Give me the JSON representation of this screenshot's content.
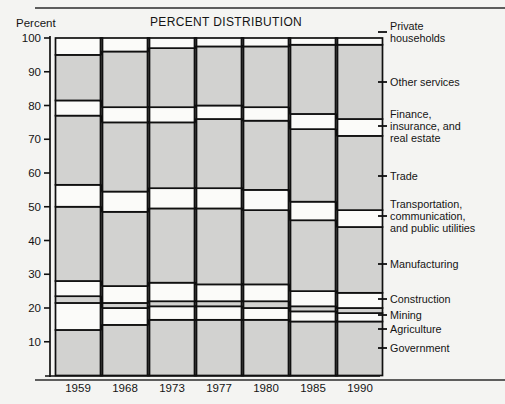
{
  "chart_data": {
    "type": "area",
    "title": "PERCENT DISTRIBUTION",
    "ylabel": "Percent",
    "xlabel": "",
    "grid": false,
    "legend_position": "right",
    "ylim": [
      0,
      100
    ],
    "yticks": [
      10,
      20,
      30,
      40,
      50,
      60,
      70,
      80,
      90,
      100
    ],
    "categories": [
      "1959",
      "1968",
      "1973",
      "1977",
      "1980",
      "1985",
      "1990"
    ],
    "stack_order_bottom_to_top": [
      "Government",
      "Agriculture",
      "Mining",
      "Construction",
      "Manufacturing",
      "Transportation, communication, and public utilities",
      "Trade",
      "Finance, insurance, and real estate",
      "Other services",
      "Private households"
    ],
    "series": [
      {
        "name": "Government",
        "fill": "shaded",
        "values": [
          13.5,
          15.0,
          16.5,
          16.5,
          16.5,
          16.0,
          16.0
        ]
      },
      {
        "name": "Agriculture",
        "fill": "open",
        "values": [
          8.0,
          5.0,
          4.0,
          4.0,
          3.5,
          3.0,
          2.5
        ]
      },
      {
        "name": "Mining",
        "fill": "shaded",
        "values": [
          2.0,
          1.5,
          1.5,
          1.5,
          2.0,
          1.5,
          1.5
        ]
      },
      {
        "name": "Construction",
        "fill": "open",
        "values": [
          4.5,
          5.0,
          5.5,
          5.0,
          5.0,
          4.5,
          4.5
        ]
      },
      {
        "name": "Manufacturing",
        "fill": "shaded",
        "values": [
          22.0,
          22.0,
          22.0,
          22.5,
          22.0,
          21.0,
          19.5
        ]
      },
      {
        "name": "Transportation, communication, and public utilities",
        "fill": "open",
        "values": [
          6.5,
          6.0,
          6.0,
          6.0,
          6.0,
          5.5,
          5.0
        ]
      },
      {
        "name": "Trade",
        "fill": "shaded",
        "values": [
          20.5,
          20.5,
          19.5,
          20.5,
          20.5,
          21.5,
          22.0
        ]
      },
      {
        "name": "Finance, insurance, and real estate",
        "fill": "open",
        "values": [
          4.5,
          4.5,
          4.5,
          4.0,
          4.0,
          4.5,
          5.0
        ]
      },
      {
        "name": "Other services",
        "fill": "shaded",
        "values": [
          13.5,
          16.5,
          17.5,
          17.5,
          18.0,
          20.5,
          22.0
        ]
      },
      {
        "name": "Private households",
        "fill": "open",
        "values": [
          5.0,
          4.0,
          3.0,
          2.5,
          2.5,
          2.0,
          2.0
        ]
      }
    ]
  },
  "axis": {
    "y_title": "Percent",
    "y_ticks": [
      "100",
      "90",
      "80",
      "70",
      "60",
      "50",
      "40",
      "30",
      "20",
      "10"
    ],
    "x_ticks": [
      "1959",
      "1968",
      "1973",
      "1977",
      "1980",
      "1985",
      "1990"
    ]
  },
  "title": {
    "main": "PERCENT DISTRIBUTION"
  },
  "legend": {
    "items": [
      {
        "label_line1": "Private",
        "label_line2": "households",
        "label_line3": ""
      },
      {
        "label_line1": "Other services",
        "label_line2": "",
        "label_line3": ""
      },
      {
        "label_line1": "Finance,",
        "label_line2": "insurance, and",
        "label_line3": "real estate"
      },
      {
        "label_line1": "Trade",
        "label_line2": "",
        "label_line3": ""
      },
      {
        "label_line1": "Transportation,",
        "label_line2": "communication,",
        "label_line3": "and public utilities"
      },
      {
        "label_line1": "Manufacturing",
        "label_line2": "",
        "label_line3": ""
      },
      {
        "label_line1": "Construction",
        "label_line2": "",
        "label_line3": ""
      },
      {
        "label_line1": "Mining",
        "label_line2": "",
        "label_line3": ""
      },
      {
        "label_line1": "Agriculture",
        "label_line2": "",
        "label_line3": ""
      },
      {
        "label_line1": "Government",
        "label_line2": "",
        "label_line3": ""
      }
    ]
  },
  "colors": {
    "ink": "#101010",
    "shaded_band": "#d2d2d0",
    "open_band": "#fbfbf9",
    "page_background": "#f4f4f2"
  }
}
